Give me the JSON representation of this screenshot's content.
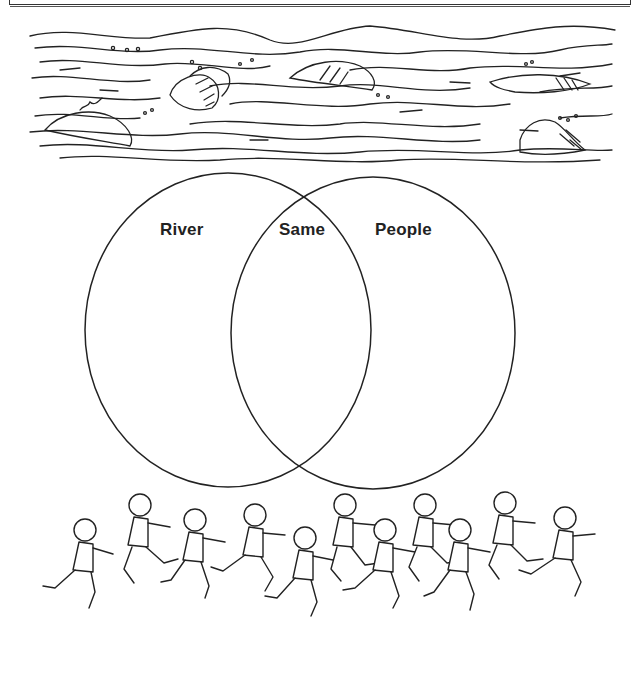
{
  "diagram": {
    "type": "venn",
    "title": "",
    "sets": [
      {
        "id": "left",
        "label": "River",
        "cx": 228,
        "cy": 330,
        "rx": 143,
        "ry": 157
      },
      {
        "id": "right",
        "label": "People",
        "cx": 373,
        "cy": 333,
        "rx": 142,
        "ry": 156
      }
    ],
    "intersection": {
      "label": "Same"
    },
    "labels": {
      "left": "River",
      "middle": "Same",
      "right": "People"
    },
    "illustrations": {
      "top": "river-waves-with-rocks",
      "bottom": "children-running"
    },
    "colors": {
      "ink": "#222222",
      "background": "#ffffff"
    }
  }
}
